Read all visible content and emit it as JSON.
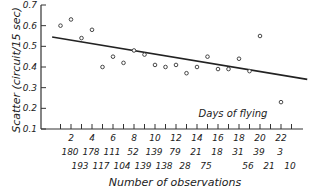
{
  "chart_data": {
    "type": "scatter",
    "title": "",
    "xlabel": "Number of observations",
    "ylabel": "Scatter (circuit/15 sec)",
    "annotation": "Days of flying",
    "xlim": [
      0,
      23
    ],
    "ylim": [
      0.1,
      0.7
    ],
    "grid": false,
    "legend": null,
    "y_ticks": [
      "0.1",
      "0.2",
      "0.3",
      "0.4",
      "0.5",
      "0.6",
      "0.7"
    ],
    "y_tick_values": [
      0.1,
      0.2,
      0.3,
      0.4,
      0.5,
      0.6,
      0.7
    ],
    "x_tick_labels": [
      "2",
      "4",
      "6",
      "8",
      "10",
      "12",
      "14",
      "16",
      "18",
      "20",
      "22"
    ],
    "x_tick_values": [
      2,
      4,
      6,
      8,
      10,
      12,
      14,
      16,
      18,
      20,
      22
    ],
    "observations_row1": [
      "180",
      "178",
      "111",
      "52",
      "139",
      "79",
      "21",
      "18",
      "31",
      "39",
      "3"
    ],
    "observations_row2": [
      "193",
      "117",
      "104",
      "139",
      "138",
      "28",
      "75",
      "",
      "56",
      "21",
      "10"
    ],
    "series": [
      {
        "name": "Scatter by day",
        "marker": "open-circle",
        "x": [
          1,
          2,
          3,
          4,
          5,
          6,
          7,
          8,
          9,
          10,
          11,
          12,
          13,
          14,
          15,
          16,
          17,
          18,
          19,
          20,
          22
        ],
        "y": [
          0.6,
          0.63,
          0.54,
          0.58,
          0.4,
          0.45,
          0.42,
          0.48,
          0.46,
          0.41,
          0.4,
          0.41,
          0.37,
          0.4,
          0.45,
          0.39,
          0.39,
          0.44,
          0.38,
          0.55,
          0.23
        ]
      }
    ],
    "trend_line": {
      "x": [
        0.2,
        24.5
      ],
      "y": [
        0.545,
        0.34
      ]
    }
  }
}
